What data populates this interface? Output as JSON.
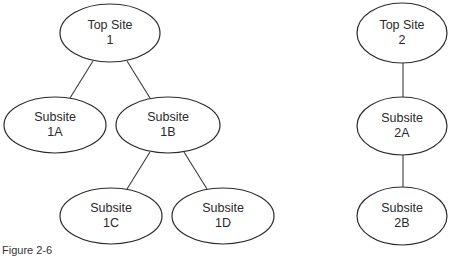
{
  "diagram": {
    "type": "tree",
    "stroke_color": "#2b2b2b",
    "background": "#ffffff",
    "nodes": [
      {
        "id": "top1",
        "line1": "Top Site",
        "line2": "1",
        "cx": 110,
        "cy": 33,
        "rx": 50,
        "ry": 29
      },
      {
        "id": "sub1a",
        "line1": "Subsite",
        "line2": "1A",
        "cx": 55,
        "cy": 125,
        "rx": 51,
        "ry": 28
      },
      {
        "id": "sub1b",
        "line1": "Subsite",
        "line2": "1B",
        "cx": 168,
        "cy": 125,
        "rx": 52,
        "ry": 28
      },
      {
        "id": "sub1c",
        "line1": "Subsite",
        "line2": "1C",
        "cx": 111,
        "cy": 216,
        "rx": 51,
        "ry": 28
      },
      {
        "id": "sub1d",
        "line1": "Subsite",
        "line2": "1D",
        "cx": 223,
        "cy": 216,
        "rx": 51,
        "ry": 28
      },
      {
        "id": "top2",
        "line1": "Top Site",
        "line2": "2",
        "cx": 402,
        "cy": 33,
        "rx": 45,
        "ry": 30
      },
      {
        "id": "sub2a",
        "line1": "Subsite",
        "line2": "2A",
        "cx": 402,
        "cy": 126,
        "rx": 45,
        "ry": 29
      },
      {
        "id": "sub2b",
        "line1": "Subsite",
        "line2": "2B",
        "cx": 402,
        "cy": 216,
        "rx": 45,
        "ry": 29
      }
    ],
    "edges": [
      {
        "from": "top1",
        "to": "sub1a"
      },
      {
        "from": "top1",
        "to": "sub1b"
      },
      {
        "from": "sub1b",
        "to": "sub1c"
      },
      {
        "from": "sub1b",
        "to": "sub1d"
      },
      {
        "from": "top2",
        "to": "sub2a"
      },
      {
        "from": "sub2a",
        "to": "sub2b"
      }
    ]
  },
  "caption": "Figure 2-6"
}
